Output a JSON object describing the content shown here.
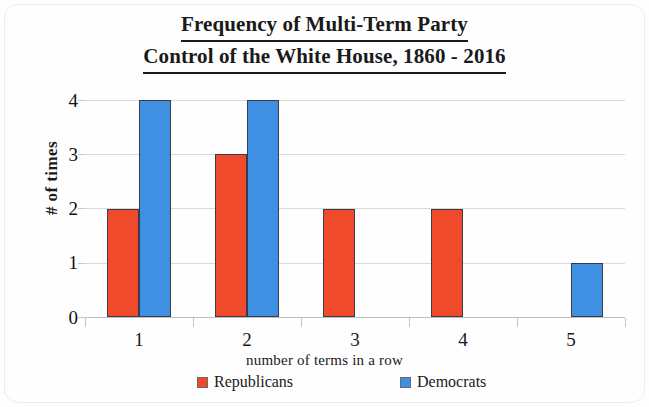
{
  "chart_data": {
    "type": "bar",
    "title": "Frequency of Multi-Term Party Control of the White House, 1860 - 2016",
    "title_lines": [
      "Frequency of Multi-Term Party",
      "Control of the White House, 1860 - 2016"
    ],
    "categories": [
      "1",
      "2",
      "3",
      "4",
      "5"
    ],
    "series": [
      {
        "name": "Republicans",
        "color": "#ef4a2c",
        "values": [
          2,
          3,
          2,
          2,
          0
        ]
      },
      {
        "name": "Democrats",
        "color": "#3f90e2",
        "values": [
          4,
          4,
          0,
          0,
          1
        ]
      }
    ],
    "xlabel": "number of terms in a row",
    "ylabel": "# of times",
    "ylim": [
      0,
      4
    ],
    "ytick_labels": [
      "0",
      "1",
      "2",
      "3",
      "4"
    ],
    "ytick_values": [
      0,
      1,
      2,
      3,
      4
    ],
    "grid": "horizontal",
    "legend_position": "bottom"
  },
  "legend": {
    "items": [
      {
        "label": "Republicans",
        "color": "#ef4a2c"
      },
      {
        "label": "Democrats",
        "color": "#3f90e2"
      }
    ]
  }
}
